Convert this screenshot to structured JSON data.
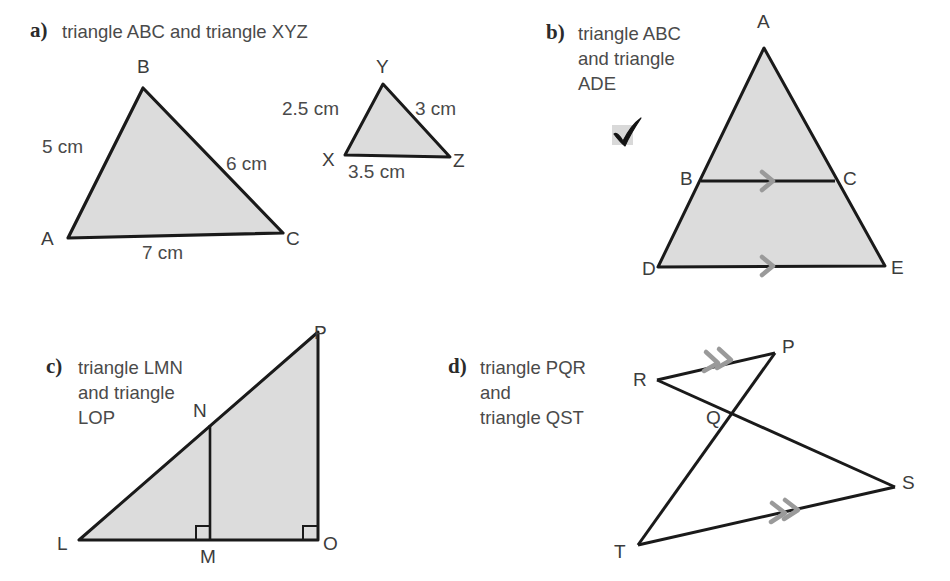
{
  "page": {
    "width": 950,
    "height": 581,
    "background": "#ffffff",
    "fill_color": "#dcdcdc",
    "stroke_color": "#1a1a1a",
    "mark_color": "#9a9a9a",
    "text_color": "#4a4a4a"
  },
  "parts": {
    "a": {
      "marker": "a)",
      "prompt": "triangle ABC and triangle XYZ",
      "triangles": [
        {
          "name": "ABC",
          "vertices": [
            {
              "label": "A",
              "x": 68,
              "y": 238
            },
            {
              "label": "B",
              "x": 143,
              "y": 88
            },
            {
              "label": "C",
              "x": 283,
              "y": 233
            }
          ],
          "side_labels": [
            {
              "text": "5 cm",
              "side": "AB"
            },
            {
              "text": "6 cm",
              "side": "BC"
            },
            {
              "text": "7 cm",
              "side": "AC"
            }
          ]
        },
        {
          "name": "XYZ",
          "vertices": [
            {
              "label": "X",
              "x": 345,
              "y": 155
            },
            {
              "label": "Y",
              "x": 383,
              "y": 84
            },
            {
              "label": "Z",
              "x": 450,
              "y": 157
            }
          ],
          "side_labels": [
            {
              "text": "2.5 cm",
              "side": "XY"
            },
            {
              "text": "3 cm",
              "side": "YZ"
            },
            {
              "text": "3.5 cm",
              "side": "XZ"
            }
          ]
        }
      ]
    },
    "b": {
      "marker": "b)",
      "prompt": "triangle ABC\nand triangle\nADE",
      "checkmark": "checkmark",
      "triangle": {
        "name": "ADE",
        "vertices": [
          {
            "label": "A",
            "x": 764,
            "y": 48
          },
          {
            "label": "D",
            "x": 658,
            "y": 267
          },
          {
            "label": "E",
            "x": 885,
            "y": 266
          }
        ],
        "midpoints": [
          {
            "label": "B",
            "x": 701,
            "y": 181
          },
          {
            "label": "C",
            "x": 835,
            "y": 181
          }
        ],
        "parallel_marks": [
          {
            "on": "BC",
            "count": 1
          },
          {
            "on": "DE",
            "count": 1
          }
        ]
      }
    },
    "c": {
      "marker": "c)",
      "prompt": "triangle LMN\nand triangle\nLOP",
      "triangle": {
        "name": "LOP",
        "vertices": [
          {
            "label": "L",
            "x": 79,
            "y": 540
          },
          {
            "label": "O",
            "x": 318,
            "y": 540
          },
          {
            "label": "P",
            "x": 318,
            "y": 332
          }
        ],
        "inner": [
          {
            "label": "M",
            "x": 210,
            "y": 540
          },
          {
            "label": "N",
            "x": 210,
            "y": 425
          }
        ],
        "right_angles": [
          "M",
          "O"
        ]
      }
    },
    "d": {
      "marker": "d)",
      "prompt": "triangle PQR\nand\ntriangle QST",
      "figure": {
        "name": "PQR-QST",
        "vertices": [
          {
            "label": "R",
            "x": 657,
            "y": 380
          },
          {
            "label": "P",
            "x": 775,
            "y": 353
          },
          {
            "label": "Q",
            "x": 735,
            "y": 415
          },
          {
            "label": "T",
            "x": 638,
            "y": 545
          },
          {
            "label": "S",
            "x": 895,
            "y": 487
          }
        ],
        "parallel_marks": [
          {
            "on": "RP",
            "count": 2
          },
          {
            "on": "TS",
            "count": 2
          }
        ]
      }
    }
  }
}
